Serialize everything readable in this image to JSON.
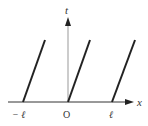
{
  "diagram": {
    "axes": {
      "horizontal_label": "x",
      "vertical_label": "t",
      "origin_label": "O"
    },
    "tick_labels": [
      "− ℓ",
      "O",
      "ℓ"
    ],
    "lines": [
      {
        "name": "line-at-minus-l",
        "x1": 23,
        "y1": 102,
        "x2": 45,
        "y2": 40
      },
      {
        "name": "line-at-origin",
        "x1": 68,
        "y1": 102,
        "x2": 90,
        "y2": 40
      },
      {
        "name": "line-at-l",
        "x1": 112,
        "y1": 102,
        "x2": 135,
        "y2": 40
      }
    ],
    "colors": {
      "axis": "#999999",
      "line": "#222222",
      "text": "#333333"
    }
  }
}
